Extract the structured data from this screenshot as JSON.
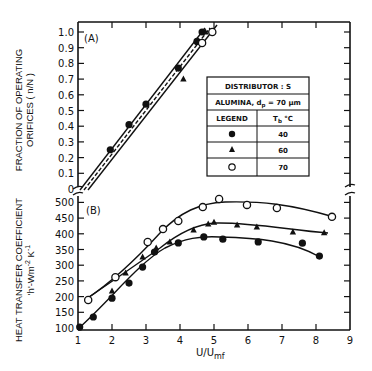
{
  "chart_data": [
    {
      "panel": "(A)",
      "type": "line",
      "ylabel": "FRACTION OF OPERATING ORIFICES ( n/N )",
      "xlabel": "U/Umf",
      "ylim": [
        0,
        1.0
      ],
      "xlim": [
        1,
        9
      ],
      "yticks": [
        "0",
        "0.1",
        "0.2",
        "0.3",
        "0.4",
        "0.5",
        "0.6",
        "0.7",
        "0.8",
        "0.9",
        "1.0"
      ],
      "series": [
        {
          "name": "40",
          "marker": "filled-circle",
          "line": "solid",
          "x": [
            1.95,
            2.5,
            3.0,
            3.95,
            4.5,
            4.65
          ],
          "y": [
            0.25,
            0.41,
            0.54,
            0.77,
            0.94,
            1.0
          ]
        },
        {
          "name": "60",
          "marker": "filled-triangle",
          "line": "dashed",
          "x": [
            4.1,
            4.75
          ],
          "y": [
            0.7,
            1.0
          ]
        },
        {
          "name": "70",
          "marker": "open-circle",
          "line": "solid",
          "x": [
            4.65,
            4.95
          ],
          "y": [
            0.93,
            1.0
          ]
        }
      ]
    },
    {
      "panel": "(B)",
      "type": "line",
      "ylabel": "HEAT TRANSFER COEFFICIENT 'h'-Wm^-2 K^-1",
      "xlabel": "U/Umf",
      "ylim": [
        100,
        500
      ],
      "xlim": [
        1,
        9
      ],
      "yticks": [
        "100",
        "150",
        "200",
        "250",
        "300",
        "350",
        "400",
        "450",
        "500"
      ],
      "xticks": [
        "1",
        "2",
        "3",
        "4",
        "5",
        "6",
        "7",
        "8",
        "9"
      ],
      "series": [
        {
          "name": "40",
          "marker": "filled-circle",
          "x": [
            1.05,
            1.45,
            2.0,
            2.5,
            2.9,
            3.25,
            3.95,
            4.7,
            5.26,
            6.3,
            7.6,
            8.1
          ],
          "y": [
            103,
            135,
            195,
            243,
            294,
            342,
            371,
            390,
            383,
            374,
            370,
            329
          ]
        },
        {
          "name": "60",
          "marker": "filled-triangle",
          "x": [
            2.0,
            2.4,
            2.9,
            3.3,
            3.7,
            4.4,
            4.83,
            5.0,
            5.68,
            6.26,
            7.32,
            8.24
          ],
          "y": [
            218,
            275,
            326,
            355,
            374,
            412,
            431,
            437,
            428,
            422,
            406,
            403
          ]
        },
        {
          "name": "70",
          "marker": "open-circle",
          "x": [
            1.3,
            2.1,
            3.05,
            3.5,
            3.95,
            4.67,
            5.15,
            5.97,
            6.85,
            8.47
          ],
          "y": [
            189,
            262,
            374,
            415,
            441,
            485,
            511,
            492,
            482,
            454
          ]
        }
      ]
    }
  ],
  "labels": {
    "panel_a": "(A)",
    "panel_b": "(B)",
    "ylabel_a_line1": "FRACTION OF OPERATING",
    "ylabel_a_line2": "ORIFICES    ( n/N )",
    "ylabel_b_line1": "HEAT TRANSFER COEFFICIENT",
    "ylabel_b_line2": "'h'-Wm",
    "ylabel_b_sup2": "-2",
    "ylabel_b_k": " K",
    "ylabel_b_sup1": "-1",
    "xlabel_main": "U/U",
    "xlabel_sub": "mf"
  },
  "ticks": {
    "a": [
      "1.0",
      "0.9",
      "0.8",
      "0.7",
      "0.6",
      "0.5",
      "0.4",
      "0.3",
      "0.2",
      "0.1",
      "0"
    ],
    "b": [
      "500",
      "450",
      "400",
      "350",
      "300",
      "250",
      "200",
      "150",
      "100"
    ],
    "x": [
      "1",
      "2",
      "3",
      "4",
      "5",
      "6",
      "7",
      "8",
      "9"
    ]
  },
  "legend_table": {
    "title": "DISTRIBUTOR :  S",
    "material": "ALUMINA, d",
    "material_sub": "p",
    "material_rest": " = 70 μm",
    "col1": "LEGEND",
    "col2_main": "T",
    "col2_sub": "b",
    "col2_rest": "  °C",
    "rows": [
      {
        "marker": "filled-circle",
        "value": "40"
      },
      {
        "marker": "filled-triangle",
        "value": "60"
      },
      {
        "marker": "open-circle",
        "value": "70"
      }
    ]
  }
}
